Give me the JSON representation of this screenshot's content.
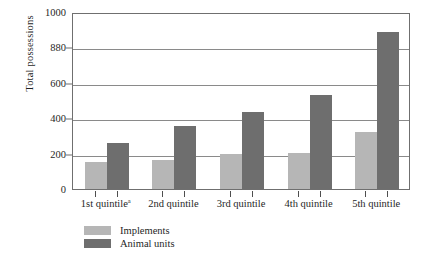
{
  "chart_data": {
    "type": "bar",
    "title": "",
    "xlabel": "",
    "ylabel": "Total possessions",
    "ylim": [
      0,
      1000
    ],
    "ytick_values": [
      0,
      200,
      400,
      600,
      800,
      1000
    ],
    "ytick_labels": [
      "0",
      "200",
      "400",
      "600",
      "880",
      "1000"
    ],
    "grid": true,
    "legend_position": "bottom-left",
    "categories": [
      "1st quintile",
      "2nd quintile",
      "3rd quintile",
      "4th quintile",
      "5th quintile"
    ],
    "category_footnotes": [
      "a",
      "",
      "",
      "",
      ""
    ],
    "series": [
      {
        "name": "Implements",
        "color": "#b6b6b6",
        "values": [
          150,
          165,
          200,
          205,
          320
        ]
      },
      {
        "name": "Animal units",
        "color": "#6e6e6e",
        "values": [
          260,
          355,
          435,
          530,
          885
        ]
      }
    ]
  },
  "axis": {
    "y_title": "Total possessions"
  },
  "legend": {
    "items": [
      {
        "label": "Implements",
        "color": "#b6b6b6"
      },
      {
        "label": "Animal units",
        "color": "#6e6e6e"
      }
    ]
  }
}
